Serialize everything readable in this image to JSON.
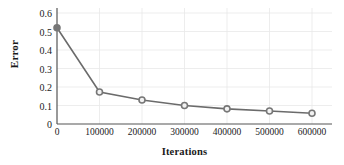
{
  "chart_data": {
    "type": "line",
    "title": "",
    "xlabel": "Iterations",
    "ylabel": "Error",
    "x": [
      0,
      100000,
      200000,
      300000,
      400000,
      500000,
      600000
    ],
    "values": [
      0.52,
      0.173,
      0.13,
      0.1,
      0.082,
      0.07,
      0.058
    ],
    "series": [
      {
        "name": "Error",
        "values": [
          0.52,
          0.173,
          0.13,
          0.1,
          0.082,
          0.07,
          0.058
        ]
      }
    ],
    "xtick_labels": [
      "0",
      "100000",
      "200000",
      "300000",
      "400000",
      "500000",
      "600000"
    ],
    "ytick_labels": [
      "0",
      "0.1",
      "0.2",
      "0.3",
      "0.4",
      "0.5",
      "0.6"
    ],
    "ytick_values": [
      0,
      0.1,
      0.2,
      0.3,
      0.4,
      0.5,
      0.6
    ],
    "xlim": [
      0,
      600000
    ],
    "ylim": [
      0,
      0.6
    ],
    "grid": true,
    "legend": "none",
    "line_color": "#6b6b6b",
    "marker_color": "#777777",
    "marker_shape": "circle",
    "grid_color": "#e8e8e8",
    "axis_color": "#555555",
    "text_color": "#1a1a1a",
    "background": "#ffffff"
  }
}
